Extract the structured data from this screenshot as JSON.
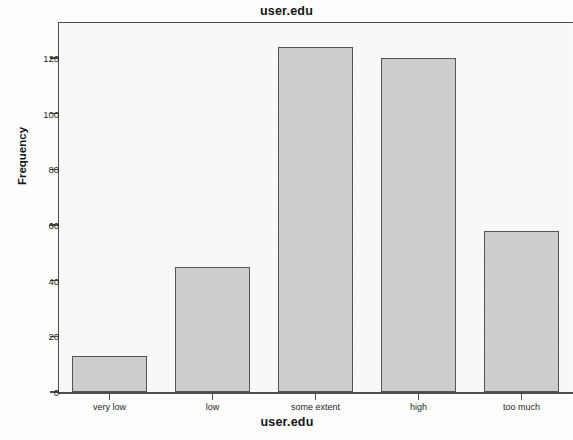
{
  "chart_data": {
    "type": "bar",
    "title": "user.edu",
    "xlabel": "user.edu",
    "ylabel": "Frequency",
    "categories": [
      "very low",
      "low",
      "some extent",
      "high",
      "too much"
    ],
    "values": [
      13,
      45,
      124,
      120,
      58
    ],
    "ylim": [
      0,
      133
    ],
    "yticks": [
      0,
      20,
      40,
      60,
      80,
      100,
      120
    ],
    "ytick_labels": [
      "0",
      "20",
      "40",
      "60",
      "80",
      "100",
      "120"
    ],
    "grid": false,
    "legend": "none",
    "bar_fill_color": "#cfcfcf",
    "bar_border_color": "#555555",
    "plot_background_color": "#fafafa",
    "axis_color": "#4e4e4e"
  }
}
